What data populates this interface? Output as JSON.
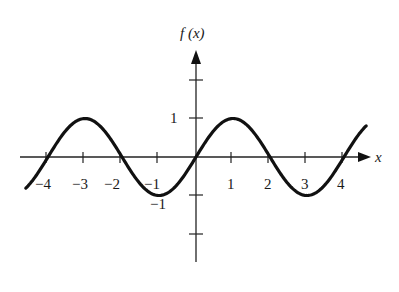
{
  "chart_data": {
    "type": "line",
    "title": "",
    "function": "f(x) = sin(pi x / 2)",
    "xlabel": "x",
    "ylabel": "f (x)",
    "xlim": [
      -4.6,
      4.6
    ],
    "ylim": [
      -2.7,
      2.8
    ],
    "grid": false,
    "legend": null,
    "x_ticks": [
      -4,
      -3,
      -2,
      -1,
      1,
      2,
      3,
      4
    ],
    "x_tick_labels": [
      "−4",
      "−3",
      "−2",
      "−1",
      "1",
      "2",
      "3",
      "4"
    ],
    "y_ticks": [
      -2,
      -1,
      1,
      2
    ],
    "y_tick_labels": [
      "",
      "−1",
      "1",
      ""
    ],
    "series": [
      {
        "name": "f(x)",
        "x": [
          -4.6,
          -4,
          -3.5,
          -3,
          -2.5,
          -2,
          -1.5,
          -1,
          -0.5,
          0,
          0.5,
          1,
          1.5,
          2,
          2.5,
          3,
          3.5,
          4,
          4.6
        ],
        "values": [
          -0.81,
          0,
          0.71,
          1,
          0.71,
          0,
          -0.71,
          -1,
          -0.71,
          0,
          0.71,
          1,
          0.71,
          0,
          -0.71,
          -1,
          -0.71,
          0,
          0.81
        ]
      }
    ]
  },
  "axes": {
    "x_label": "x",
    "y_label": "f (x)",
    "tick_labels": {
      "xm4": "−4",
      "xm3": "−3",
      "xm2": "−2",
      "xm1": "−1",
      "x1": "1",
      "x2": "2",
      "x3": "3",
      "x4": "4",
      "y1": "1",
      "ym1": "−1"
    }
  }
}
